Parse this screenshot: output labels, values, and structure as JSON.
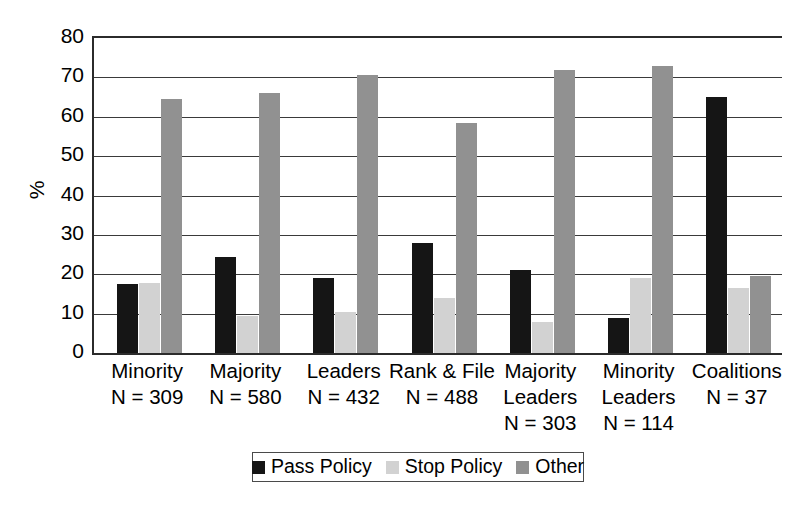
{
  "chart_data": {
    "type": "bar",
    "title": "",
    "xlabel": "",
    "ylabel": "%",
    "ylim": [
      0,
      80
    ],
    "yticks": [
      80,
      70,
      60,
      50,
      40,
      30,
      20,
      10,
      0
    ],
    "grid": true,
    "legend_position": "bottom",
    "categories": [
      "Minority",
      "Majority",
      "Leaders",
      "Rank & File",
      "Majority Leaders",
      "Minority Leaders",
      "Coalitions"
    ],
    "category_labels": [
      {
        "name": "Minority",
        "n_label": "N = 309",
        "n": 309,
        "lines": [
          "Minority",
          "N = 309"
        ]
      },
      {
        "name": "Majority",
        "n_label": "N = 580",
        "n": 580,
        "lines": [
          "Majority",
          "N = 580"
        ]
      },
      {
        "name": "Leaders",
        "n_label": "N = 432",
        "n": 432,
        "lines": [
          "Leaders",
          "N = 432"
        ]
      },
      {
        "name": "Rank & File",
        "n_label": "N = 488",
        "n": 488,
        "lines": [
          "Rank & File",
          "N = 488"
        ]
      },
      {
        "name": "Majority Leaders",
        "n_label": "N = 303",
        "n": 303,
        "lines": [
          "Majority",
          "Leaders",
          "N = 303"
        ]
      },
      {
        "name": "Minority Leaders",
        "n_label": "N = 114",
        "n": 114,
        "lines": [
          "Minority",
          "Leaders",
          "N = 114"
        ]
      },
      {
        "name": "Coalitions",
        "n_label": "N = 37",
        "n": 37,
        "lines": [
          "Coalitions",
          "N = 37"
        ]
      }
    ],
    "series": [
      {
        "name": "Pass Policy",
        "color": "#151515",
        "values": [
          17.5,
          24.5,
          19.0,
          28.0,
          21.0,
          9.0,
          65.0
        ]
      },
      {
        "name": "Stop Policy",
        "color": "#d2d2d2",
        "values": [
          17.8,
          9.5,
          10.5,
          14.0,
          8.0,
          19.0,
          16.5
        ]
      },
      {
        "name": "Other",
        "color": "#919191",
        "values": [
          64.5,
          66.0,
          70.5,
          58.5,
          72.0,
          73.0,
          19.5
        ]
      }
    ]
  },
  "legend": {
    "items": [
      {
        "label": "Pass Policy"
      },
      {
        "label": "Stop Policy"
      },
      {
        "label": "Other"
      }
    ]
  },
  "axis": {
    "y_title": "%"
  }
}
